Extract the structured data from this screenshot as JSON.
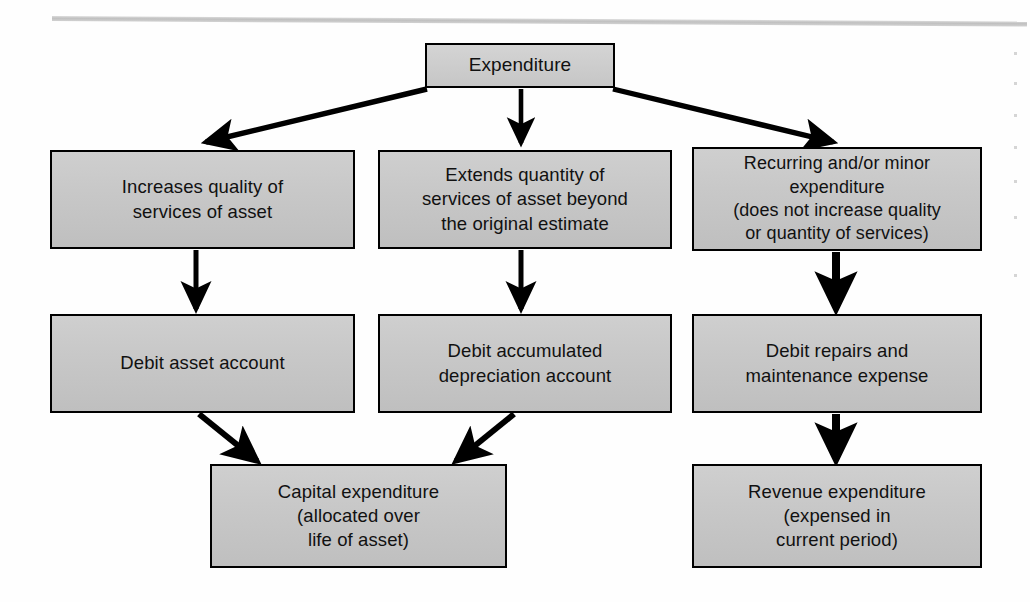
{
  "diagram": {
    "type": "flowchart",
    "nodes": [
      {
        "id": "expenditure",
        "label": "Expenditure"
      },
      {
        "id": "increase-quality",
        "label": "Increases quality of\nservices of asset"
      },
      {
        "id": "extends-quantity",
        "label": "Extends quantity of\nservices of asset beyond\nthe original estimate"
      },
      {
        "id": "recurring-minor",
        "label": "Recurring and/or minor\nexpenditure\n(does not increase quality\nor quantity of services)"
      },
      {
        "id": "debit-asset",
        "label": "Debit asset account"
      },
      {
        "id": "debit-accum",
        "label": "Debit accumulated\ndepreciation account"
      },
      {
        "id": "debit-repairs",
        "label": "Debit repairs and\nmaintenance expense"
      },
      {
        "id": "capital-exp",
        "label": "Capital expenditure\n(allocated over\nlife of asset)"
      },
      {
        "id": "revenue-exp",
        "label": "Revenue expenditure\n(expensed in\ncurrent period)"
      }
    ],
    "edges": [
      {
        "from": "expenditure",
        "to": "increase-quality",
        "style": "diagonal-left"
      },
      {
        "from": "expenditure",
        "to": "extends-quantity",
        "style": "vertical"
      },
      {
        "from": "expenditure",
        "to": "recurring-minor",
        "style": "diagonal-right"
      },
      {
        "from": "increase-quality",
        "to": "debit-asset",
        "style": "vertical"
      },
      {
        "from": "extends-quantity",
        "to": "debit-accum",
        "style": "vertical"
      },
      {
        "from": "recurring-minor",
        "to": "debit-repairs",
        "style": "vertical-thick"
      },
      {
        "from": "debit-asset",
        "to": "capital-exp",
        "style": "diagonal-right"
      },
      {
        "from": "debit-accum",
        "to": "capital-exp",
        "style": "diagonal-left"
      },
      {
        "from": "debit-repairs",
        "to": "revenue-exp",
        "style": "vertical-thick"
      }
    ],
    "colors": {
      "box_fill": "#c7c7c7",
      "box_border": "#000000",
      "arrow": "#000000",
      "page_background": "#ffffff",
      "text": "#111111"
    }
  }
}
